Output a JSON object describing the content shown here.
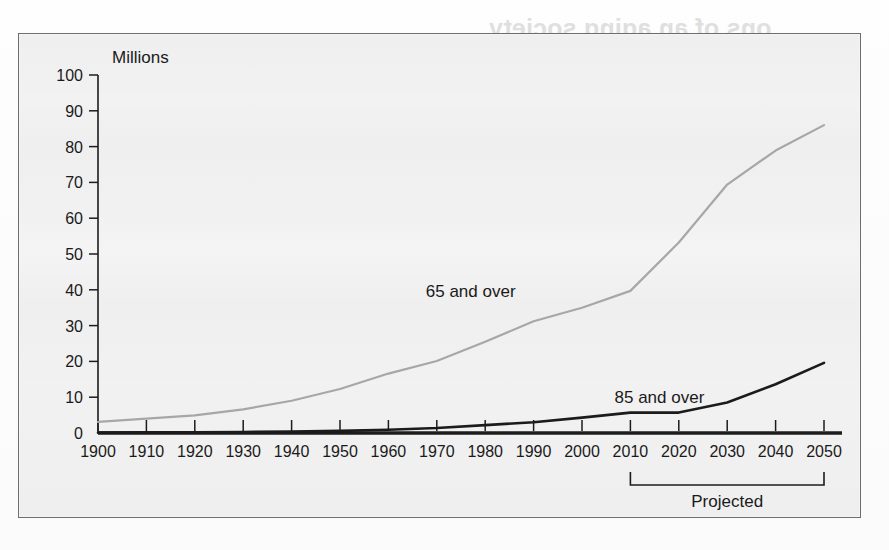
{
  "figure": {
    "frame_border_color": "#6d6d6d",
    "background_color": "#efefef",
    "paper_color": "#fdfdfd"
  },
  "ghost_text": {
    "title": "...ons of an aging society",
    "subtitle": "...as Health and medical issues, Social...",
    "line3": "...continued support...",
    "body": "...the next several decades..."
  },
  "chart_data": {
    "type": "line",
    "title": "",
    "xlabel": "",
    "ylabel": "Millions",
    "ylim": [
      0,
      100
    ],
    "xlim": [
      1900,
      2050
    ],
    "yticks": [
      0,
      10,
      20,
      30,
      40,
      50,
      60,
      70,
      80,
      90,
      100
    ],
    "xticks": [
      1900,
      1910,
      1920,
      1930,
      1940,
      1950,
      1960,
      1970,
      1980,
      1990,
      2000,
      2010,
      2020,
      2030,
      2040,
      2050
    ],
    "ytick_labels": [
      "0",
      "10",
      "20",
      "30",
      "40",
      "50",
      "60",
      "70",
      "80",
      "90",
      "100"
    ],
    "xtick_labels": [
      "1900",
      "1910",
      "1920",
      "1930",
      "1940",
      "1950",
      "1960",
      "1970",
      "1980",
      "1990",
      "2000",
      "2010",
      "2020",
      "2030",
      "2040",
      "2050"
    ],
    "grid": false,
    "legend_position": "inline-labels",
    "x": [
      1900,
      1910,
      1920,
      1930,
      1940,
      1950,
      1960,
      1970,
      1980,
      1990,
      2000,
      2010,
      2020,
      2030,
      2040,
      2050
    ],
    "series": [
      {
        "name": "65 and over",
        "color": "#a7a7a7",
        "label_x": 1977,
        "label_y": 38,
        "values": [
          3.1,
          4.0,
          4.9,
          6.6,
          9.0,
          12.3,
          16.6,
          20.1,
          25.5,
          31.2,
          35.0,
          39.7,
          53.2,
          69.4,
          78.9,
          86.0
        ]
      },
      {
        "name": "85 and over",
        "color": "#1b1b1b",
        "label_x": 2016,
        "label_y": 8.5,
        "values": [
          0.1,
          0.2,
          0.2,
          0.3,
          0.4,
          0.6,
          0.9,
          1.4,
          2.2,
          3.0,
          4.3,
          5.7,
          5.7,
          8.5,
          13.6,
          19.6
        ]
      }
    ],
    "annotations": [
      {
        "name": "projected-bracket",
        "text": "Projected",
        "x_start": 2010,
        "x_end": 2050
      }
    ]
  }
}
